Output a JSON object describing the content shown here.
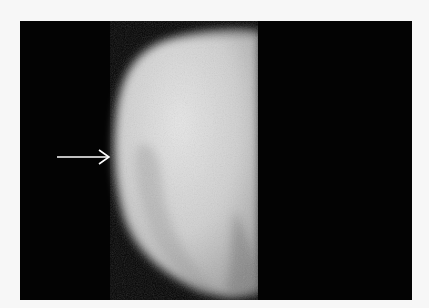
{
  "image": {
    "description": "Grayscale radiograph of a tooth-like structure on black background with a white arrow pointing to the left edge",
    "background_color": "#f7f7f7",
    "frame_color": "#030303",
    "subject_color": "#d8d8d8",
    "annotation": {
      "type": "arrow",
      "direction": "right",
      "color": "#ffffff"
    }
  }
}
